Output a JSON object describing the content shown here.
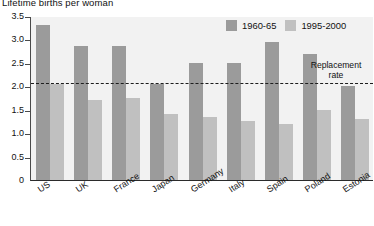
{
  "chart_data": {
    "type": "bar",
    "title": "Lifetime births per woman",
    "xlabel": "",
    "ylabel": "",
    "ylim": [
      0,
      3.5
    ],
    "yticks": [
      "0",
      "0.5",
      "1.0",
      "1.5",
      "2.0",
      "2.5",
      "3.0",
      "3.5"
    ],
    "ytick_values": [
      0,
      0.5,
      1.0,
      1.5,
      2.0,
      2.5,
      3.0,
      3.5
    ],
    "grid": false,
    "legend_position": "top-right",
    "categories": [
      "US",
      "UK",
      "France",
      "Japan",
      "Germany",
      "Italy",
      "Spain",
      "Poland",
      "Estonia"
    ],
    "series": [
      {
        "name": "1960-65",
        "color": "#9b9b9b",
        "values": [
          3.3,
          2.85,
          2.85,
          2.05,
          2.5,
          2.5,
          2.95,
          2.7,
          2.0
        ]
      },
      {
        "name": "1995-2000",
        "color": "#c0c0c0",
        "values": [
          2.05,
          1.7,
          1.75,
          1.4,
          1.35,
          1.25,
          1.2,
          1.5,
          1.3
        ]
      }
    ],
    "annotations": [
      {
        "name": "replacement-rate",
        "label_line1": "Replacement",
        "label_line2": "rate",
        "value": 2.1,
        "style": "dashed"
      }
    ]
  },
  "colors": {
    "series_1960_65": "#9b9b9b",
    "series_1995_2000": "#c0c0c0",
    "plot_background": "#f2f2f2",
    "axis": "#2b2b2b",
    "text": "#111111"
  }
}
